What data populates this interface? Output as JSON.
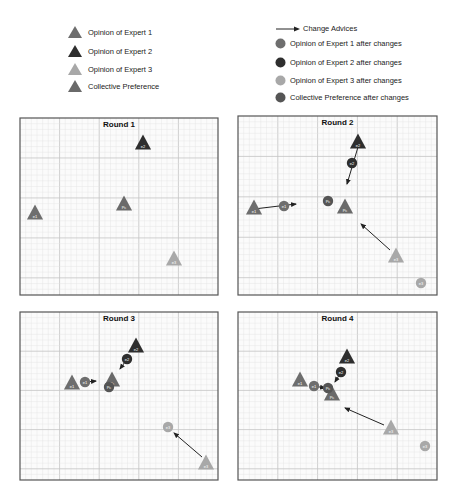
{
  "legend": {
    "left": [
      {
        "label": "Opinion of Expert 1",
        "marker": "triangle",
        "code": "e1",
        "color": "#6e6e6e"
      },
      {
        "label": "Opinion of Expert 2",
        "marker": "triangle",
        "code": "e2",
        "color": "#2e2e2e"
      },
      {
        "label": "Opinion of Expert 3",
        "marker": "triangle",
        "code": "e3",
        "color": "#a8a8a8"
      },
      {
        "label": "Collective Preference",
        "marker": "triangle",
        "code": "Pc",
        "color": "#6a6a6a"
      }
    ],
    "right": [
      {
        "label": "Change Advices",
        "marker": "arrow"
      },
      {
        "label": "Opinion of Expert 1 after changes",
        "marker": "circle",
        "code": "e1",
        "color": "#6e6e6e"
      },
      {
        "label": "Opinion of Expert 2 after changes",
        "marker": "circle",
        "code": "e2",
        "color": "#2e2e2e"
      },
      {
        "label": "Opinion of Expert 3 after changes",
        "marker": "circle",
        "code": "e3",
        "color": "#a8a8a8"
      },
      {
        "label": "Collective Preference after changes",
        "marker": "circle",
        "code": "Pc",
        "color": "#555555"
      }
    ]
  },
  "panels": [
    {
      "title": "Round 1",
      "box": {
        "x": 20,
        "y": 118,
        "w": 198,
        "h": 177
      },
      "triangles": [
        {
          "code": "e2",
          "x": 143,
          "y": 143
        },
        {
          "code": "Pc",
          "x": 124,
          "y": 204
        },
        {
          "code": "e1",
          "x": 35,
          "y": 213
        },
        {
          "code": "e3",
          "x": 174,
          "y": 259
        }
      ],
      "circles": [],
      "arrows": []
    },
    {
      "title": "Round 2",
      "box": {
        "x": 238,
        "y": 116,
        "w": 199,
        "h": 179
      },
      "triangles": [
        {
          "code": "e2",
          "x": 358,
          "y": 142
        },
        {
          "code": "e1",
          "x": 254,
          "y": 208
        },
        {
          "code": "Pc",
          "x": 345,
          "y": 207
        },
        {
          "code": "e3",
          "x": 396,
          "y": 256
        }
      ],
      "circles": [
        {
          "code": "e2",
          "x": 352,
          "y": 163
        },
        {
          "code": "e1",
          "x": 284,
          "y": 206
        },
        {
          "code": "Pc",
          "x": 328,
          "y": 201
        },
        {
          "code": "e3",
          "x": 421,
          "y": 283
        }
      ],
      "arrows": [
        {
          "from": [
            358,
            147
          ],
          "to": [
            347,
            184
          ]
        },
        {
          "from": [
            254,
            209
          ],
          "to": [
            296,
            204
          ]
        },
        {
          "from": [
            390,
            250
          ],
          "to": [
            361,
            224
          ]
        }
      ]
    },
    {
      "title": "Round 3",
      "box": {
        "x": 20,
        "y": 312,
        "w": 198,
        "h": 168
      },
      "triangles": [
        {
          "code": "e2",
          "x": 136,
          "y": 346
        },
        {
          "code": "e1",
          "x": 72,
          "y": 383
        },
        {
          "code": "Pc",
          "x": 112,
          "y": 380
        },
        {
          "code": "e3",
          "x": 206,
          "y": 463
        }
      ],
      "circles": [
        {
          "code": "e2",
          "x": 127,
          "y": 359
        },
        {
          "code": "e1",
          "x": 85,
          "y": 382
        },
        {
          "code": "Pc",
          "x": 109,
          "y": 387
        },
        {
          "code": "e3",
          "x": 168,
          "y": 427
        }
      ],
      "arrows": [
        {
          "from": [
            127,
            359
          ],
          "to": [
            120,
            369
          ]
        },
        {
          "from": [
            85,
            382
          ],
          "to": [
            96,
            381
          ]
        },
        {
          "from": [
            202,
            457
          ],
          "to": [
            174,
            433
          ]
        }
      ]
    },
    {
      "title": "Round 4",
      "box": {
        "x": 238,
        "y": 312,
        "w": 199,
        "h": 168
      },
      "triangles": [
        {
          "code": "e2",
          "x": 347,
          "y": 357
        },
        {
          "code": "e1",
          "x": 300,
          "y": 380
        },
        {
          "code": "Pc",
          "x": 332,
          "y": 394
        },
        {
          "code": "e3",
          "x": 391,
          "y": 428
        }
      ],
      "circles": [
        {
          "code": "e2",
          "x": 341,
          "y": 372
        },
        {
          "code": "e1",
          "x": 314,
          "y": 386
        },
        {
          "code": "Pc",
          "x": 328,
          "y": 388
        },
        {
          "code": "e3",
          "x": 425,
          "y": 446
        }
      ],
      "arrows": [
        {
          "from": [
            341,
            372
          ],
          "to": [
            335,
            382
          ]
        },
        {
          "from": [
            314,
            386
          ],
          "to": [
            325,
            388
          ]
        },
        {
          "from": [
            384,
            425
          ],
          "to": [
            345,
            408
          ]
        }
      ]
    }
  ],
  "colors": {
    "e1": "#6e6e6e",
    "e2": "#2e2e2e",
    "e3": "#a8a8a8",
    "Pc_triangle": "#6a6a6a",
    "Pc_circle": "#555555",
    "grid_minor": "#e3e3e3",
    "grid_major": "#c4c4c4",
    "frame": "#555555",
    "arrow": "#222222"
  }
}
